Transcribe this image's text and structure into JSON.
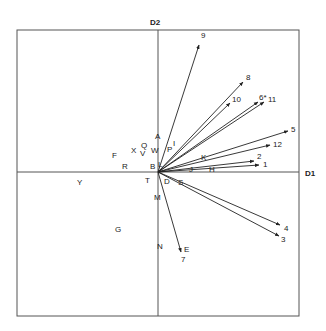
{
  "diagram": {
    "axes": {
      "x_label": "D1",
      "y_label": "D2"
    },
    "frame": {
      "x1": 17,
      "y1": 30,
      "x2": 299,
      "y2": 316
    },
    "origin": {
      "x": 158,
      "y": 172
    },
    "arrows": [
      {
        "id": "9",
        "label": "9",
        "x": 199,
        "y": 45,
        "lx": 201,
        "ly": 38
      },
      {
        "id": "8",
        "label": "8",
        "x": 243,
        "y": 82,
        "lx": 246,
        "ly": 80
      },
      {
        "id": "10",
        "label": "10",
        "x": 230,
        "y": 103,
        "lx": 232,
        "ly": 102
      },
      {
        "id": "6",
        "label": "6*",
        "x": 258,
        "y": 102,
        "lx": 259,
        "ly": 100
      },
      {
        "id": "11",
        "label": "11",
        "x": 264,
        "y": 102,
        "lx": 268,
        "ly": 102
      },
      {
        "id": "5",
        "label": "5",
        "x": 288,
        "y": 131,
        "lx": 291,
        "ly": 132
      },
      {
        "id": "12",
        "label": "12",
        "x": 270,
        "y": 145,
        "lx": 273,
        "ly": 147
      },
      {
        "id": "2",
        "label": "2",
        "x": 254,
        "y": 161,
        "lx": 257,
        "ly": 159
      },
      {
        "id": "1",
        "label": "1",
        "x": 259,
        "y": 165,
        "lx": 263,
        "ly": 167
      },
      {
        "id": "4",
        "label": "4",
        "x": 280,
        "y": 225,
        "lx": 284,
        "ly": 231
      },
      {
        "id": "3",
        "label": "3",
        "x": 279,
        "y": 236,
        "lx": 281,
        "ly": 242
      },
      {
        "id": "7",
        "label": "7",
        "x": 181,
        "y": 252,
        "lx": 181,
        "ly": 262
      }
    ],
    "points": [
      {
        "label": "A",
        "x": 155,
        "y": 139
      },
      {
        "label": "P",
        "x": 167,
        "y": 152
      },
      {
        "label": "I",
        "x": 173,
        "y": 146
      },
      {
        "label": "W",
        "x": 151,
        "y": 153
      },
      {
        "label": "Q",
        "x": 141,
        "y": 148
      },
      {
        "label": "V",
        "x": 140,
        "y": 156
      },
      {
        "label": "X",
        "x": 131,
        "y": 153
      },
      {
        "label": "F",
        "x": 112,
        "y": 158
      },
      {
        "label": "R",
        "x": 122,
        "y": 169
      },
      {
        "label": "B",
        "x": 150,
        "y": 169
      },
      {
        "label": "L",
        "x": 158,
        "y": 167
      },
      {
        "label": "K",
        "x": 201,
        "y": 160
      },
      {
        "label": "J",
        "x": 189,
        "y": 172
      },
      {
        "label": "H",
        "x": 209,
        "y": 172
      },
      {
        "label": "Y",
        "x": 77,
        "y": 185
      },
      {
        "label": "T",
        "x": 145,
        "y": 183
      },
      {
        "label": "D",
        "x": 164,
        "y": 184
      },
      {
        "label": "S",
        "x": 178,
        "y": 185
      },
      {
        "label": "M",
        "x": 154,
        "y": 200
      },
      {
        "label": "G",
        "x": 115,
        "y": 232
      },
      {
        "label": "N",
        "x": 157,
        "y": 249
      },
      {
        "label": "E",
        "x": 184,
        "y": 252
      }
    ]
  }
}
